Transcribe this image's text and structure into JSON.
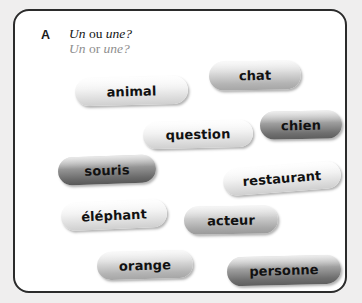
{
  "exercise": {
    "letter": "A",
    "prompt_fr_parts": [
      {
        "text": "Un",
        "style": "italic"
      },
      {
        "text": " ou ",
        "style": "roman"
      },
      {
        "text": "une?",
        "style": "italic"
      }
    ],
    "prompt_en_parts": [
      {
        "text": "Un",
        "style": "italic"
      },
      {
        "text": " or ",
        "style": "roman"
      },
      {
        "text": "une?",
        "style": "italic"
      }
    ],
    "prompt_fr": "Un ou une?",
    "prompt_en": "Un or une?"
  },
  "panel": {
    "border_color": "#2b2b2b",
    "background_color": "#ffffff",
    "page_background_color": "#efeeee"
  },
  "words": [
    {
      "label": "animal",
      "tone": "light",
      "left": 60,
      "top": 66,
      "width": 113,
      "height": 28,
      "rotate": -1.5
    },
    {
      "label": "chat",
      "tone": "mid",
      "left": 194,
      "top": 50,
      "width": 92,
      "height": 29,
      "rotate": -1.0
    },
    {
      "label": "question",
      "tone": "light",
      "left": 128,
      "top": 110,
      "width": 110,
      "height": 27,
      "rotate": -1.5
    },
    {
      "label": "chien",
      "tone": "dark",
      "left": 245,
      "top": 100,
      "width": 82,
      "height": 28,
      "rotate": -1.0
    },
    {
      "label": "souris",
      "tone": "dark2",
      "left": 43,
      "top": 145,
      "width": 98,
      "height": 28,
      "rotate": -2.0
    },
    {
      "label": "restaurant",
      "tone": "light",
      "left": 208,
      "top": 154,
      "width": 118,
      "height": 27,
      "rotate": -4.5
    },
    {
      "label": "éléphant",
      "tone": "light",
      "left": 46,
      "top": 190,
      "width": 106,
      "height": 28,
      "rotate": -2.5
    },
    {
      "label": "acteur",
      "tone": "mid2",
      "left": 169,
      "top": 195,
      "width": 94,
      "height": 28,
      "rotate": -1.0
    },
    {
      "label": "orange",
      "tone": "mid",
      "left": 82,
      "top": 240,
      "width": 96,
      "height": 28,
      "rotate": -1.5
    },
    {
      "label": "personne",
      "tone": "dark",
      "left": 212,
      "top": 245,
      "width": 114,
      "height": 29,
      "rotate": -1.5
    }
  ]
}
